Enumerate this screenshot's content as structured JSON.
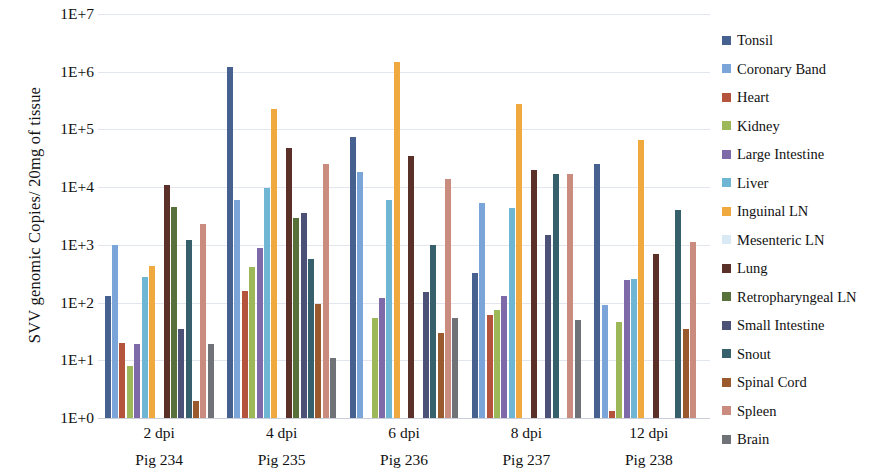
{
  "chart_data": {
    "type": "bar",
    "title": "",
    "xlabel": "",
    "ylabel": "SVV genomic  Copies/ 20mg of tissue",
    "yscale": "log",
    "ylim": [
      1,
      10000000
    ],
    "ytick_labels": [
      "1E+7",
      "1E+6",
      "1E+5",
      "1E+4",
      "1E+3",
      "1E+2",
      "1E+1",
      "1E+0"
    ],
    "ytick_values": [
      10000000,
      1000000,
      100000,
      10000,
      1000,
      100,
      10,
      1
    ],
    "grid": true,
    "legend_position": "right",
    "categories": [
      "Pig 234",
      "Pig 235",
      "Pig 236",
      "Pig 237",
      "Pig 238"
    ],
    "category_sublabels": [
      "2 dpi",
      "4 dpi",
      "6 dpi",
      "8 dpi",
      "12 dpi"
    ],
    "series": [
      {
        "name": "Tonsil",
        "color": "#46608f",
        "values": [
          130,
          1200000,
          75000,
          330,
          25000
        ]
      },
      {
        "name": "Coronary Band",
        "color": "#7ba4d9",
        "values": [
          1000,
          6000,
          18000,
          5300,
          90
        ]
      },
      {
        "name": "Heart",
        "color": "#b4543c",
        "values": [
          20,
          160,
          0,
          60,
          1.3
        ]
      },
      {
        "name": "Kidney",
        "color": "#9cb858",
        "values": [
          8,
          420,
          55,
          75,
          46
        ]
      },
      {
        "name": "Large Intestine",
        "color": "#7e6aa8",
        "values": [
          19,
          900,
          120,
          130,
          250
        ]
      },
      {
        "name": "Liver",
        "color": "#6fb6d4",
        "values": [
          280,
          9500,
          6000,
          4400,
          260
        ]
      },
      {
        "name": "Inguinal LN",
        "color": "#f0a93e",
        "values": [
          430,
          230000,
          1500000,
          280000,
          65000
        ]
      },
      {
        "name": "Mesenteric LN",
        "color": "#daeaf5",
        "values": [
          0,
          0,
          0,
          0,
          0
        ]
      },
      {
        "name": "Lung",
        "color": "#5a3028",
        "values": [
          11000,
          48000,
          35000,
          20000,
          700
        ]
      },
      {
        "name": "Retropharyngeal LN",
        "color": "#58703a",
        "values": [
          4500,
          2900,
          0,
          0,
          0
        ]
      },
      {
        "name": "Small Intestine",
        "color": "#4c5277",
        "values": [
          35,
          3500,
          150,
          1500,
          0
        ]
      },
      {
        "name": "Snout",
        "color": "#36606b",
        "values": [
          1200,
          560,
          1000,
          17000,
          4000
        ]
      },
      {
        "name": "Spinal Cord",
        "color": "#9a5a2d",
        "values": [
          2,
          95,
          30,
          0,
          35
        ]
      },
      {
        "name": "Spleen",
        "color": "#c98c7e",
        "values": [
          2300,
          25000,
          14000,
          17000,
          1100
        ]
      },
      {
        "name": "Brain",
        "color": "#6f7277",
        "values": [
          19,
          11,
          55,
          50,
          0
        ]
      }
    ]
  },
  "axis": {
    "y_title": "SVV genomic  Copies/ 20mg of tissue",
    "y_ticks": [
      "1E+7",
      "1E+6",
      "1E+5",
      "1E+4",
      "1E+3",
      "1E+2",
      "1E+1",
      "1E+0"
    ],
    "x_groups": [
      {
        "dpi": "2 dpi",
        "pig": "Pig 234"
      },
      {
        "dpi": "4 dpi",
        "pig": "Pig 235"
      },
      {
        "dpi": "6 dpi",
        "pig": "Pig 236"
      },
      {
        "dpi": "8 dpi",
        "pig": "Pig 237"
      },
      {
        "dpi": "12 dpi",
        "pig": "Pig 238"
      }
    ]
  },
  "legend": {
    "items": [
      {
        "label": "Tonsil",
        "color": "#46608f"
      },
      {
        "label": "Coronary Band",
        "color": "#7ba4d9"
      },
      {
        "label": "Heart",
        "color": "#b4543c"
      },
      {
        "label": "Kidney",
        "color": "#9cb858"
      },
      {
        "label": "Large Intestine",
        "color": "#7e6aa8"
      },
      {
        "label": "Liver",
        "color": "#6fb6d4"
      },
      {
        "label": "Inguinal LN",
        "color": "#f0a93e"
      },
      {
        "label": "Mesenteric LN",
        "color": "#daeaf5"
      },
      {
        "label": "Lung",
        "color": "#5a3028"
      },
      {
        "label": "Retropharyngeal LN",
        "color": "#58703a"
      },
      {
        "label": "Small Intestine",
        "color": "#4c5277"
      },
      {
        "label": "Snout",
        "color": "#36606b"
      },
      {
        "label": "Spinal Cord",
        "color": "#9a5a2d"
      },
      {
        "label": "Spleen",
        "color": "#c98c7e"
      },
      {
        "label": "Brain",
        "color": "#6f7277"
      }
    ]
  }
}
